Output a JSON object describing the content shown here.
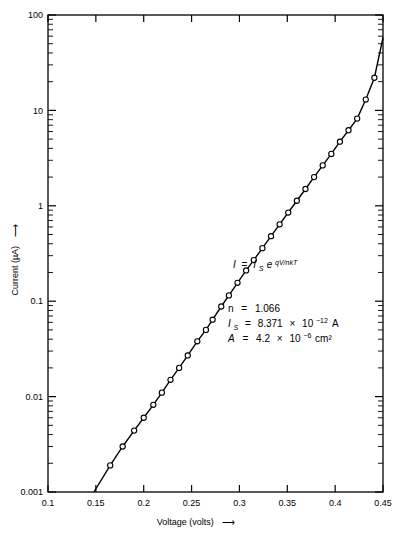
{
  "chart_data": {
    "type": "line",
    "title": "",
    "xlabel": "Voltage (volts)",
    "ylabel": "Current (µA)",
    "xlabel_arrow": "⟶",
    "ylabel_arrow": "⟶",
    "xscale": "linear",
    "yscale": "log",
    "xlim": [
      0.1,
      0.45
    ],
    "ylim": [
      0.001,
      100
    ],
    "grid": false,
    "legend": "none",
    "marker": "open-circle",
    "xticks": [
      0.1,
      0.15,
      0.2,
      0.25,
      0.3,
      0.35,
      0.4,
      0.45
    ],
    "xticklabels": [
      "0.1",
      "0.15",
      "0.2",
      "0.25",
      "0.3",
      "0.35",
      "0.4",
      "0.45"
    ],
    "yticks": [
      0.001,
      0.01,
      0.1,
      1,
      10,
      100
    ],
    "yticklabels": [
      "0.001",
      "0.01",
      "0.1",
      "1",
      "10",
      "100"
    ],
    "series": [
      {
        "name": "diode I-V",
        "x": [
          0.148,
          0.165,
          0.178,
          0.19,
          0.2,
          0.21,
          0.219,
          0.228,
          0.237,
          0.246,
          0.256,
          0.265,
          0.272,
          0.281,
          0.289,
          0.298,
          0.307,
          0.315,
          0.324,
          0.333,
          0.342,
          0.351,
          0.36,
          0.369,
          0.378,
          0.387,
          0.396,
          0.405,
          0.414,
          0.423,
          0.432,
          0.441,
          0.45
        ],
        "y": [
          0.001,
          0.0019,
          0.003,
          0.0044,
          0.006,
          0.0082,
          0.011,
          0.015,
          0.02,
          0.027,
          0.038,
          0.05,
          0.064,
          0.088,
          0.115,
          0.156,
          0.21,
          0.27,
          0.36,
          0.48,
          0.64,
          0.85,
          1.13,
          1.5,
          2.0,
          2.65,
          3.5,
          4.7,
          6.2,
          8.2,
          13.0,
          22.0,
          58.0
        ]
      }
    ],
    "annotations": {
      "equation": {
        "I": "I",
        "equals": "=",
        "IS": "I",
        "IS_sub": "S",
        "e": "e",
        "exponent": "qV/nkT"
      },
      "parameters": [
        {
          "symbol": "n",
          "symbol_sub": "",
          "equals": "=",
          "value": "1.066",
          "mantissa": "",
          "times": "",
          "base": "",
          "exponent": "",
          "unit": ""
        },
        {
          "symbol": "I",
          "symbol_sub": "S",
          "equals": "=",
          "value": "",
          "mantissa": "8.371",
          "times": "×",
          "base": "10",
          "exponent": "−12",
          "unit": "A"
        },
        {
          "symbol": "A",
          "symbol_sub": "",
          "equals": "=",
          "value": "",
          "mantissa": "4.2",
          "times": "×",
          "base": "10",
          "exponent": "−6",
          "unit": "cm²"
        }
      ]
    }
  },
  "colors": {
    "axis": "#000000",
    "curve": "#000000",
    "marker_fill": "#ffffff",
    "background": "#ffffff"
  }
}
